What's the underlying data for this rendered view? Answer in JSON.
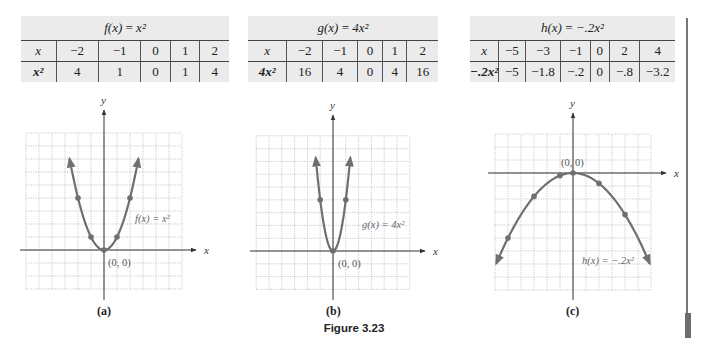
{
  "figure_caption": "Figure 3.23",
  "tables": [
    {
      "title_fn": "f(x)",
      "title_eq": "=",
      "title_rhs": "x²",
      "row_labels": [
        "x",
        "x²"
      ],
      "x": [
        "−2",
        "−1",
        "0",
        "1",
        "2"
      ],
      "y": [
        "4",
        "1",
        "0",
        "1",
        "4"
      ]
    },
    {
      "title_fn": "g(x)",
      "title_eq": "=",
      "title_rhs": "4x²",
      "row_labels": [
        "x",
        "4x²"
      ],
      "x": [
        "−2",
        "−1",
        "0",
        "1",
        "2"
      ],
      "y": [
        "16",
        "4",
        "0",
        "4",
        "16"
      ]
    },
    {
      "title_fn": "h(x)",
      "title_eq": "=",
      "title_rhs": "−.2x²",
      "row_labels": [
        "x",
        "−.2x²"
      ],
      "x": [
        "−5",
        "−3",
        "−1",
        "0",
        "2",
        "4"
      ],
      "y": [
        "−5",
        "−1.8",
        "−.2",
        "0",
        "−.8",
        "−3.2"
      ]
    }
  ],
  "graphs": [
    {
      "sublabel": "(a)",
      "curve_label": "f(x) = x²",
      "origin_label": "(0, 0)",
      "x_axis": "x",
      "y_axis": "y"
    },
    {
      "sublabel": "(b)",
      "curve_label": "g(x) = 4x²",
      "origin_label": "(0, 0)",
      "x_axis": "x",
      "y_axis": "y"
    },
    {
      "sublabel": "(c)",
      "curve_label": "h(x) = −.2x²",
      "origin_label": "(0, 0)",
      "x_axis": "x",
      "y_axis": "y"
    }
  ],
  "colors": {
    "curve": "#6f6f6f",
    "point": "#6f6f6f",
    "grid": "#bdbdbd",
    "axis": "#333333",
    "table_bg": "#ebebeb"
  },
  "chart_data": [
    {
      "type": "line",
      "title": "f(x) = x^2",
      "xlabel": "x",
      "ylabel": "y",
      "x": [
        -2,
        -1,
        0,
        1,
        2
      ],
      "values": [
        4,
        1,
        0,
        1,
        4
      ],
      "xlim": [
        -6,
        6
      ],
      "ylim": [
        -3,
        9
      ],
      "grid": true,
      "annotations": [
        "(0, 0)",
        "f(x) = x^2"
      ],
      "sublabel": "(a)"
    },
    {
      "type": "line",
      "title": "g(x) = 4x^2",
      "xlabel": "x",
      "ylabel": "y",
      "x": [
        -2,
        -1,
        0,
        1,
        2
      ],
      "values": [
        16,
        4,
        0,
        4,
        16
      ],
      "plotted_points": [
        [
          -1,
          4
        ],
        [
          0,
          0
        ],
        [
          1,
          4
        ]
      ],
      "xlim": [
        -6,
        6
      ],
      "ylim": [
        -3,
        9
      ],
      "grid": true,
      "annotations": [
        "(0, 0)",
        "g(x) = 4x^2"
      ],
      "sublabel": "(b)"
    },
    {
      "type": "line",
      "title": "h(x) = -.2x^2",
      "xlabel": "x",
      "ylabel": "y",
      "x": [
        -5,
        -3,
        -1,
        0,
        2,
        4
      ],
      "values": [
        -5,
        -1.8,
        -0.2,
        0,
        -0.8,
        -3.2
      ],
      "xlim": [
        -6,
        6
      ],
      "ylim": [
        -9,
        3
      ],
      "grid": true,
      "annotations": [
        "(0, 0)",
        "h(x) = -.2x^2"
      ],
      "sublabel": "(c)"
    }
  ]
}
